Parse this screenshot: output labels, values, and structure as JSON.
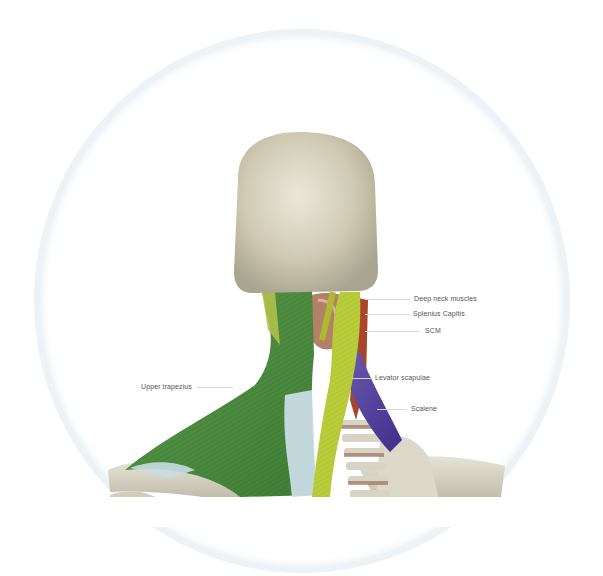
{
  "figure": {
    "labels": [
      {
        "id": "deep-neck-muscles",
        "text": "Deep neck muscles",
        "x": 414,
        "y": 295,
        "line_x1": 365,
        "line_x2": 410
      },
      {
        "id": "splenius-capitis",
        "text": "Splenius Capitis",
        "x": 413,
        "y": 310,
        "line_x1": 365,
        "line_x2": 410
      },
      {
        "id": "scm",
        "text": "SCM",
        "x": 425,
        "y": 327,
        "line_x1": 365,
        "line_x2": 420
      },
      {
        "id": "levator-scapulae",
        "text": "Levator scapulae",
        "x": 375,
        "y": 374,
        "line_x1": 350,
        "line_x2": 371
      },
      {
        "id": "scalene",
        "text": "Scalene",
        "x": 411,
        "y": 405,
        "line_x1": 375,
        "line_x2": 407
      },
      {
        "id": "upper-trapezius",
        "text": "Upper trapezius",
        "x": 141,
        "y": 383,
        "line_x1": 197,
        "line_x2": 233
      }
    ],
    "colors": {
      "skull": "#d7d2bf",
      "bone": "#d9d5c6",
      "trapezius_green": "#4a8a3e",
      "splenius_yellow": "#b9cc3a",
      "levator_purple": "#5a45a0",
      "scm_red": "#a8452a",
      "tendon_blue": "#c9dce4",
      "frame_ring": "#e2ecef"
    }
  }
}
